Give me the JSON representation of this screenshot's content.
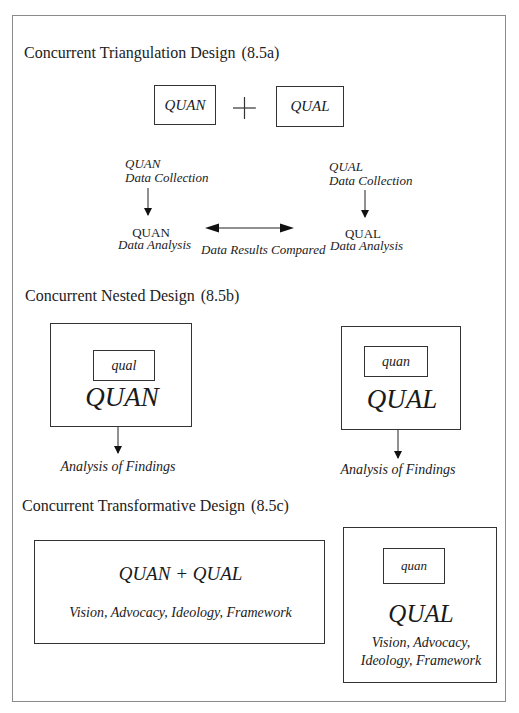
{
  "figure": {
    "sections": [
      {
        "id": "8.5a",
        "title": "Concurrent Triangulation Design",
        "number": "(8.5a)",
        "top_boxes": [
          "QUAN",
          "QUAL"
        ],
        "plus": "+",
        "left_column": {
          "collection_line1": "QUAN",
          "collection_line2": "Data Collection",
          "analysis_line1": "QUAN",
          "analysis_line2": "Data Analysis"
        },
        "right_column": {
          "collection_line1": "QUAL",
          "collection_line2": "Data Collection",
          "analysis_line1": "QUAL",
          "analysis_line2": "Data Analysis"
        },
        "compare_label": "Data Results Compared"
      },
      {
        "id": "8.5b",
        "title": "Concurrent Nested Design",
        "number": "(8.5b)",
        "left": {
          "inner": "qual",
          "outer": "QUAN",
          "output": "Analysis of Findings"
        },
        "right": {
          "inner": "quan",
          "outer": "QUAL",
          "output": "Analysis of Findings"
        }
      },
      {
        "id": "8.5c",
        "title": "Concurrent Transformative Design",
        "number": "(8.5c)",
        "left": {
          "main": "QUAN + QUAL",
          "lens": "Vision, Advocacy, Ideology, Framework"
        },
        "right": {
          "inner": "quan",
          "outer": "QUAL",
          "lens_line1": "Vision, Advocacy,",
          "lens_line2": "Ideology, Framework"
        }
      }
    ]
  }
}
